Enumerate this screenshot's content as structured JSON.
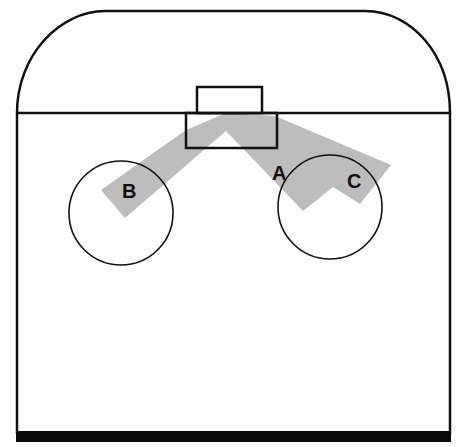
{
  "diagram": {
    "type": "schematic room/rink layout with shaded zone and circles",
    "caption_cutoff_text": "",
    "colors": {
      "stroke": "#111111",
      "shaded_zone": "#bdbdbd",
      "background": "#ffffff",
      "bottom_bar": "#0a0a0a"
    },
    "labels": {
      "a": "A",
      "b": "B",
      "c": "C"
    },
    "elements": {
      "outer_boundary": "rounded-top enclosure",
      "divider_line": "horizontal line",
      "small_upper_box": "small rectangle above divider",
      "lower_box": "rectangle below divider",
      "shaded_band": "inverted-V shaded zone",
      "circle_left": "circle containing B",
      "circle_right": "circle containing C",
      "bottom_bar": "thick base line"
    }
  }
}
